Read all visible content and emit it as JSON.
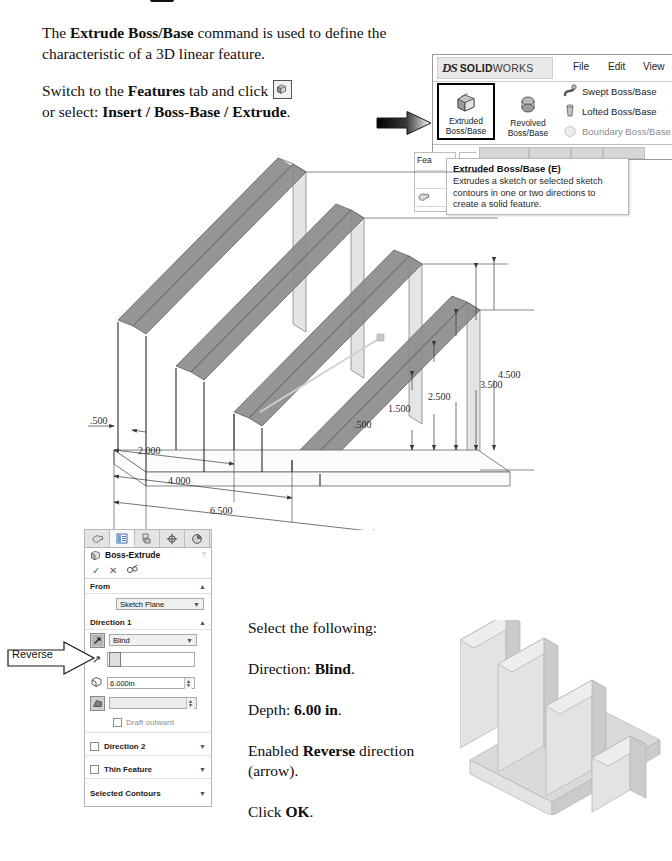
{
  "document": {
    "intro_lead": "The ",
    "intro_bold": "Extrude Boss/Base",
    "intro_rest": " command is used to define the characteristic of a 3D linear feature.",
    "switch_lead": "Switch to the ",
    "switch_bold": "Features",
    "switch_mid": " tab and click ",
    "switch_rest": "or select: ",
    "switch_path": "Insert / Boss-Base / Extrude",
    "switch_end": "."
  },
  "ribbon": {
    "brand_ds": "DS",
    "brand_solid": "SOLID",
    "brand_works": "WORKS",
    "menus": [
      "File",
      "Edit",
      "View"
    ],
    "buttons": {
      "extruded": "Extruded\nBoss/Base",
      "extruded_line1": "Extruded",
      "extruded_line2": "Boss/Base",
      "revolved_line1": "Revolved",
      "revolved_line2": "Boss/Base",
      "swept": "Swept Boss/Base",
      "lofted": "Lofted Boss/Base",
      "boundary": "Boundary Boss/Base"
    },
    "tab_features": "Fea"
  },
  "tooltip": {
    "title": "Extruded Boss/Base   (E)",
    "body": "Extrudes a sketch or selected sketch contours in one or two directions to create a solid feature."
  },
  "drawing": {
    "horizontal_dims": [
      ".500",
      "2.000",
      "4.000",
      "6.500"
    ],
    "vertical_dims": [
      ".500",
      "1.500",
      "2.500",
      "3.500",
      "4.500"
    ]
  },
  "property_manager": {
    "tabs": [
      {
        "name": "feature-manager-tree-tab",
        "glyph": "tree"
      },
      {
        "name": "property-manager-tab",
        "glyph": "property"
      },
      {
        "name": "configuration-manager-tab",
        "glyph": "config"
      },
      {
        "name": "dimxpert-manager-tab",
        "glyph": "dimxpert"
      },
      {
        "name": "display-manager-tab",
        "glyph": "display"
      }
    ],
    "title": "Boss-Extrude",
    "help": "?",
    "actions": {
      "ok": "✓",
      "cancel": "✕",
      "detailed_preview": "Ɣ"
    },
    "from": {
      "header": "From",
      "value": "Sketch Plane"
    },
    "direction1": {
      "header": "Direction 1",
      "end_condition": "Blind",
      "depth": "6.000in",
      "draft": "Draft outward",
      "direction_vector_placeholder": "",
      "draft_angle_placeholder": ""
    },
    "direction2": {
      "header": "Direction 2"
    },
    "thin_feature": {
      "header": "Thin Feature"
    },
    "selected_contours": {
      "header": "Selected Contours"
    }
  },
  "callout": {
    "reverse": "Reverse"
  },
  "instructions": {
    "lead": "Select the following:",
    "direction_label": "Direction: ",
    "direction_value": "Blind",
    "direction_end": ".",
    "depth_label": "Depth: ",
    "depth_value": "6.00 in",
    "depth_end": ".",
    "reverse_lead": "Enabled ",
    "reverse_bold": "Reverse",
    "reverse_rest": " direction (arrow).",
    "click_lead": "Click ",
    "click_bold": "OK",
    "click_end": "."
  },
  "colors": {
    "page_bg": "#ffffff",
    "ink": "#101010",
    "panel_border": "#b5b5b5",
    "panel_header": "#e4e4e4",
    "field_bg": "#f0f0f0",
    "model_light": "#e9e9e9",
    "model_mid": "#cfcfcf",
    "model_dark": "#9f9f9f",
    "preview_gray": "#8c8c8c",
    "disabled_text": "#8d8d8d"
  }
}
